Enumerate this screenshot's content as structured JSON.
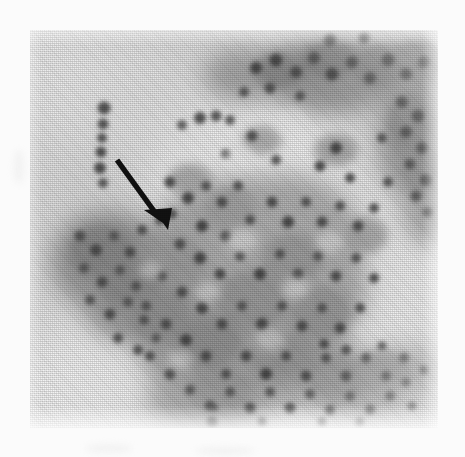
{
  "figure": {
    "kind": "photomicrograph",
    "modality": "light-microscopy-halftone-print-scan",
    "caption": "",
    "plate": {
      "x": 30,
      "y": 30,
      "width": 408,
      "height": 398,
      "background_hex": "#d9d9d9",
      "page_margin_hex": "#fbfbfb",
      "tone_range": {
        "lightest_hex": "#f0f0f0",
        "mid_hex": "#a8a8a8",
        "darkest_hex": "#4a4a4a"
      }
    },
    "annotation": {
      "type": "arrow",
      "name": "pointer-arrow",
      "color_hex": "#131313",
      "shaft_start": {
        "x": 117,
        "y": 160
      },
      "shaft_end": {
        "x": 157,
        "y": 214
      },
      "head_tip": {
        "x": 163,
        "y": 222
      },
      "shaft_width_px": 5,
      "points_to": "cell-cluster-center-left"
    },
    "regions": [
      {
        "name": "central-cell-mass",
        "cx": 230,
        "cy": 250,
        "rx": 120,
        "ry": 110,
        "tone_hex": "#9a9a9a"
      },
      {
        "name": "left-dark-clump",
        "cx": 100,
        "cy": 255,
        "rx": 58,
        "ry": 52,
        "tone_hex": "#8a8a8a"
      },
      {
        "name": "upper-right-dark-band",
        "cx": 330,
        "cy": 75,
        "rx": 90,
        "ry": 42,
        "tone_hex": "#8f8f8f"
      },
      {
        "name": "right-edge-cell-strand",
        "cx": 410,
        "cy": 120,
        "rx": 34,
        "ry": 62,
        "tone_hex": "#8d8d8d"
      },
      {
        "name": "lower-right-extension",
        "cx": 355,
        "cy": 385,
        "rx": 62,
        "ry": 34,
        "tone_hex": "#9d9d9d"
      },
      {
        "name": "isolated-cell-chain-upper-left",
        "cx": 104,
        "cy": 138,
        "rx": 9,
        "ry": 36,
        "tone_hex": "#777777"
      },
      {
        "name": "light-background-field",
        "cx": 255,
        "cy": 140,
        "rx": 62,
        "ry": 52,
        "tone_hex": "#ededed"
      }
    ],
    "nuclei_count_visible": 168
  }
}
